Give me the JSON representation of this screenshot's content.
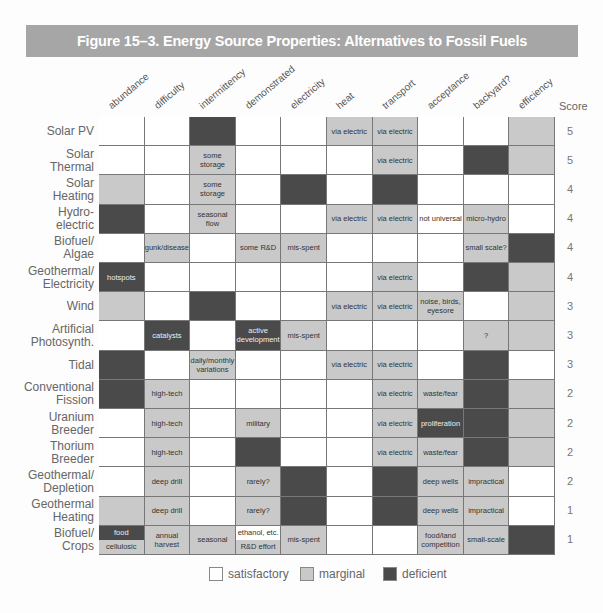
{
  "title": "Figure 15–3. Energy Source Properties: Alternatives to Fossil Fuels",
  "colors": {
    "satisfactory": "#ffffff",
    "marginal": "#c9c9c9",
    "deficient": "#4a4a4a",
    "title_bar": "#a6a6a6"
  },
  "score_header": "Score",
  "legend": [
    {
      "key": "s",
      "label": "satisfactory"
    },
    {
      "key": "m",
      "label": "marginal"
    },
    {
      "key": "d",
      "label": "deficient"
    }
  ],
  "chart_data": {
    "type": "table",
    "title": "Figure 15–3. Energy Source Properties: Alternatives to Fossil Fuels",
    "columns": [
      "abundance",
      "difficulty",
      "intermittency",
      "demonstrated",
      "electricity",
      "heat",
      "transport",
      "acceptance",
      "backyard?",
      "efficiency"
    ],
    "legend": {
      "s": "satisfactory",
      "m": "marginal",
      "d": "deficient"
    },
    "rows": [
      {
        "name": [
          "Solar PV"
        ],
        "score": "5",
        "cells": [
          {
            "r": "s"
          },
          {
            "r": "s"
          },
          {
            "r": "d"
          },
          {
            "r": "s"
          },
          {
            "r": "s"
          },
          {
            "r": "m",
            "t": "via electric"
          },
          {
            "r": "m",
            "t": "via electric"
          },
          {
            "r": "s"
          },
          {
            "r": "s"
          },
          {
            "r": "m"
          }
        ]
      },
      {
        "name": [
          "Solar",
          "Thermal"
        ],
        "score": "5",
        "cells": [
          {
            "r": "s"
          },
          {
            "r": "s"
          },
          {
            "r": "m",
            "t": "some storage"
          },
          {
            "r": "s"
          },
          {
            "r": "s"
          },
          {
            "r": "s"
          },
          {
            "r": "m",
            "t": "via electric"
          },
          {
            "r": "s"
          },
          {
            "r": "d"
          },
          {
            "r": "m"
          }
        ]
      },
      {
        "name": [
          "Solar",
          "Heating"
        ],
        "score": "4",
        "cells": [
          {
            "r": "m"
          },
          {
            "r": "s"
          },
          {
            "r": "m",
            "t": "some storage"
          },
          {
            "r": "s"
          },
          {
            "r": "d"
          },
          {
            "r": "s"
          },
          {
            "r": "d"
          },
          {
            "r": "s"
          },
          {
            "r": "s"
          },
          {
            "r": "s"
          }
        ]
      },
      {
        "name": [
          "Hydro-",
          "electric"
        ],
        "score": "4",
        "cells": [
          {
            "r": "d"
          },
          {
            "r": "s"
          },
          {
            "r": "m",
            "t": "seasonal flow"
          },
          {
            "r": "s"
          },
          {
            "r": "s"
          },
          {
            "r": "m",
            "t": "via electric"
          },
          {
            "r": "m",
            "t": "via electric"
          },
          {
            "r": "s",
            "t": "not universal"
          },
          {
            "r": "m",
            "t": "micro-hydro"
          },
          {
            "r": "s"
          }
        ]
      },
      {
        "name": [
          "Biofuel/",
          "Algae"
        ],
        "score": "4",
        "cells": [
          {
            "r": "s"
          },
          {
            "r": "m",
            "t": "gunk/disease"
          },
          {
            "r": "s"
          },
          {
            "r": "m",
            "t": "some R&D"
          },
          {
            "r": "m",
            "t": "mis-spent"
          },
          {
            "r": "s"
          },
          {
            "r": "s"
          },
          {
            "r": "s"
          },
          {
            "r": "m",
            "t": "small scale?"
          },
          {
            "r": "d"
          }
        ]
      },
      {
        "name": [
          "Geothermal/",
          "Electricity"
        ],
        "score": "4",
        "cells": [
          {
            "r": "d",
            "t": "hotspots"
          },
          {
            "r": "s"
          },
          {
            "r": "s"
          },
          {
            "r": "s"
          },
          {
            "r": "s"
          },
          {
            "r": "s"
          },
          {
            "r": "m",
            "t": "via electric"
          },
          {
            "r": "s"
          },
          {
            "r": "d"
          },
          {
            "r": "m"
          }
        ]
      },
      {
        "name": [
          "Wind"
        ],
        "score": "3",
        "cells": [
          {
            "r": "m"
          },
          {
            "r": "s"
          },
          {
            "r": "d"
          },
          {
            "r": "s"
          },
          {
            "r": "s"
          },
          {
            "r": "m",
            "t": "via electric"
          },
          {
            "r": "m",
            "t": "via electric"
          },
          {
            "r": "m",
            "t": "noise, birds, eyesore"
          },
          {
            "r": "s"
          },
          {
            "r": "m"
          }
        ]
      },
      {
        "name": [
          "Artificial",
          "Photosynth."
        ],
        "score": "3",
        "cells": [
          {
            "r": "s"
          },
          {
            "r": "d",
            "t": "catalysts"
          },
          {
            "r": "s"
          },
          {
            "r": "d",
            "t": "active development"
          },
          {
            "r": "m",
            "t": "mis-spent"
          },
          {
            "r": "s"
          },
          {
            "r": "s"
          },
          {
            "r": "s"
          },
          {
            "r": "m",
            "t": "?"
          },
          {
            "r": "m"
          }
        ]
      },
      {
        "name": [
          "Tidal"
        ],
        "score": "3",
        "cells": [
          {
            "r": "d"
          },
          {
            "r": "s"
          },
          {
            "r": "m",
            "t": "daily/monthly variations"
          },
          {
            "r": "s"
          },
          {
            "r": "s"
          },
          {
            "r": "m",
            "t": "via electric"
          },
          {
            "r": "m",
            "t": "via electric"
          },
          {
            "r": "s"
          },
          {
            "r": "d"
          },
          {
            "r": "s"
          }
        ]
      },
      {
        "name": [
          "Conventional",
          "Fission"
        ],
        "score": "2",
        "cells": [
          {
            "r": "d"
          },
          {
            "r": "m",
            "t": "high-tech"
          },
          {
            "r": "s"
          },
          {
            "r": "s"
          },
          {
            "r": "s"
          },
          {
            "r": "s"
          },
          {
            "r": "m",
            "t": "via electric"
          },
          {
            "r": "m",
            "t": "waste/fear"
          },
          {
            "r": "d"
          },
          {
            "r": "m"
          }
        ]
      },
      {
        "name": [
          "Uranium",
          "Breeder"
        ],
        "score": "2",
        "cells": [
          {
            "r": "s"
          },
          {
            "r": "m",
            "t": "high-tech"
          },
          {
            "r": "s"
          },
          {
            "r": "m",
            "t": "military"
          },
          {
            "r": "s"
          },
          {
            "r": "s"
          },
          {
            "r": "m",
            "t": "via electric"
          },
          {
            "r": "d",
            "t": "proliferation"
          },
          {
            "r": "d"
          },
          {
            "r": "m"
          }
        ]
      },
      {
        "name": [
          "Thorium",
          "Breeder"
        ],
        "score": "2",
        "cells": [
          {
            "r": "s"
          },
          {
            "r": "m",
            "t": "high-tech"
          },
          {
            "r": "s"
          },
          {
            "r": "d"
          },
          {
            "r": "s"
          },
          {
            "r": "s"
          },
          {
            "r": "m",
            "t": "via electric"
          },
          {
            "r": "m",
            "t": "waste/fear"
          },
          {
            "r": "d"
          },
          {
            "r": "m"
          }
        ]
      },
      {
        "name": [
          "Geothermal/",
          "Depletion"
        ],
        "score": "2",
        "cells": [
          {
            "r": "s"
          },
          {
            "r": "m",
            "t": "deep drill"
          },
          {
            "r": "s"
          },
          {
            "r": "m",
            "t": "rarely?"
          },
          {
            "r": "d"
          },
          {
            "r": "s"
          },
          {
            "r": "d"
          },
          {
            "r": "m",
            "t": "deep wells"
          },
          {
            "r": "m",
            "t": "impractical"
          },
          {
            "r": "s"
          }
        ]
      },
      {
        "name": [
          "Geothermal",
          "Heating"
        ],
        "score": "1",
        "cells": [
          {
            "r": "m"
          },
          {
            "r": "m",
            "t": "deep drill"
          },
          {
            "r": "s"
          },
          {
            "r": "m",
            "t": "rarely?"
          },
          {
            "r": "d"
          },
          {
            "r": "s"
          },
          {
            "r": "d"
          },
          {
            "r": "m",
            "t": "deep wells"
          },
          {
            "r": "m",
            "t": "impractical"
          },
          {
            "r": "s"
          }
        ]
      },
      {
        "name": [
          "Biofuel/",
          "Crops"
        ],
        "score": "1",
        "cells": [
          {
            "split": [
              {
                "r": "d",
                "t": "food"
              },
              {
                "r": "m",
                "t": "cellulosic"
              }
            ]
          },
          {
            "r": "m",
            "t": "annual harvest"
          },
          {
            "r": "m",
            "t": "seasonal"
          },
          {
            "split": [
              {
                "r": "s",
                "t": "ethanol, etc."
              },
              {
                "r": "m",
                "t": "R&D effort"
              }
            ]
          },
          {
            "r": "m",
            "t": "mis-spent"
          },
          {
            "r": "s"
          },
          {
            "r": "s"
          },
          {
            "r": "m",
            "t": "food/land competition"
          },
          {
            "r": "m",
            "t": "small-scale"
          },
          {
            "r": "d"
          }
        ]
      }
    ]
  }
}
